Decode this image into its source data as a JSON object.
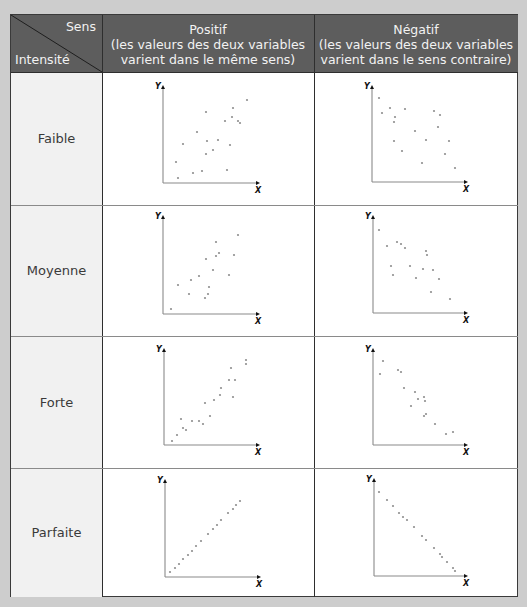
{
  "header": {
    "corner_top": "Sens",
    "corner_bottom": "Intensité",
    "columns": [
      {
        "title": "Positif",
        "line1": "(les valeurs des deux variables",
        "line2": "varient dans le même sens)"
      },
      {
        "title": "Négatif",
        "line1": "(les valeurs des deux variables",
        "line2": "varient dans le sens contraire)"
      }
    ]
  },
  "rows": [
    {
      "label": "Faible"
    },
    {
      "label": "Moyenne"
    },
    {
      "label": "Forte"
    },
    {
      "label": "Parfaite"
    }
  ],
  "axis_labels": {
    "x": "X",
    "y": "Y"
  },
  "colors": {
    "header_bg": "#5d5d5d",
    "header_text": "#f2f2f2",
    "label_bg": "#f1f1f1",
    "dot": "#8f8f8f",
    "axis": "#8a8a8a"
  },
  "chart_data": [
    {
      "type": "scatter",
      "title": "Positif — Faible",
      "xlabel": "X",
      "ylabel": "Y",
      "axes": {
        "ox": 163,
        "oy": 183,
        "top": 85,
        "right": 260
      },
      "points": [
        [
          247,
          100
        ],
        [
          233,
          108
        ],
        [
          206,
          112
        ],
        [
          232,
          117
        ],
        [
          225,
          121
        ],
        [
          238,
          121
        ],
        [
          240,
          123
        ],
        [
          197,
          132
        ],
        [
          183,
          144
        ],
        [
          207,
          141
        ],
        [
          218,
          140
        ],
        [
          230,
          145
        ],
        [
          213,
          150
        ],
        [
          206,
          154
        ],
        [
          176,
          162
        ],
        [
          227,
          170
        ],
        [
          193,
          173
        ],
        [
          202,
          171
        ],
        [
          178,
          178
        ]
      ]
    },
    {
      "type": "scatter",
      "title": "Négatif — Faible",
      "xlabel": "X",
      "ylabel": "Y",
      "axes": {
        "ox": 372,
        "oy": 182,
        "top": 85,
        "right": 468
      },
      "points": [
        [
          379,
          98
        ],
        [
          390,
          108
        ],
        [
          405,
          109
        ],
        [
          382,
          113
        ],
        [
          395,
          117
        ],
        [
          394,
          122
        ],
        [
          434,
          111
        ],
        [
          440,
          115
        ],
        [
          438,
          127
        ],
        [
          415,
          131
        ],
        [
          426,
          140
        ],
        [
          449,
          141
        ],
        [
          394,
          141
        ],
        [
          402,
          151
        ],
        [
          445,
          154
        ],
        [
          422,
          163
        ],
        [
          455,
          168
        ]
      ]
    },
    {
      "type": "scatter",
      "title": "Positif — Moyenne",
      "xlabel": "X",
      "ylabel": "Y",
      "axes": {
        "ox": 163,
        "oy": 314,
        "top": 215,
        "right": 260
      },
      "points": [
        [
          238,
          235
        ],
        [
          216,
          242
        ],
        [
          219,
          253
        ],
        [
          216,
          256
        ],
        [
          234,
          255
        ],
        [
          206,
          259
        ],
        [
          213,
          270
        ],
        [
          229,
          275
        ],
        [
          199,
          276
        ],
        [
          191,
          280
        ],
        [
          178,
          285
        ],
        [
          209,
          287
        ],
        [
          189,
          294
        ],
        [
          208,
          294
        ],
        [
          205,
          298
        ],
        [
          171,
          309
        ]
      ]
    },
    {
      "type": "scatter",
      "title": "Négatif — Moyenne",
      "xlabel": "X",
      "ylabel": "Y",
      "axes": {
        "ox": 373,
        "oy": 313,
        "top": 215,
        "right": 468
      },
      "points": [
        [
          379,
          230
        ],
        [
          387,
          246
        ],
        [
          397,
          242
        ],
        [
          401,
          244
        ],
        [
          405,
          248
        ],
        [
          426,
          251
        ],
        [
          427,
          255
        ],
        [
          391,
          266
        ],
        [
          410,
          266
        ],
        [
          423,
          269
        ],
        [
          433,
          270
        ],
        [
          393,
          275
        ],
        [
          416,
          278
        ],
        [
          439,
          279
        ],
        [
          431,
          292
        ],
        [
          450,
          299
        ]
      ]
    },
    {
      "type": "scatter",
      "title": "Positif — Forte",
      "xlabel": "X",
      "ylabel": "Y",
      "axes": {
        "ox": 164,
        "oy": 445,
        "top": 348,
        "right": 260
      },
      "points": [
        [
          246,
          360
        ],
        [
          246,
          364
        ],
        [
          231,
          368
        ],
        [
          229,
          380
        ],
        [
          235,
          380
        ],
        [
          221,
          388
        ],
        [
          220,
          395
        ],
        [
          233,
          397
        ],
        [
          214,
          400
        ],
        [
          205,
          403
        ],
        [
          210,
          416
        ],
        [
          181,
          419
        ],
        [
          192,
          421
        ],
        [
          199,
          421
        ],
        [
          203,
          424
        ],
        [
          183,
          428
        ],
        [
          186,
          430
        ],
        [
          177,
          435
        ],
        [
          172,
          441
        ]
      ]
    },
    {
      "type": "scatter",
      "title": "Négatif — Forte",
      "xlabel": "X",
      "ylabel": "Y",
      "axes": {
        "ox": 373,
        "oy": 445,
        "top": 348,
        "right": 468
      },
      "points": [
        [
          383,
          361
        ],
        [
          380,
          374
        ],
        [
          398,
          370
        ],
        [
          401,
          372
        ],
        [
          404,
          388
        ],
        [
          415,
          392
        ],
        [
          424,
          397
        ],
        [
          418,
          399
        ],
        [
          425,
          401
        ],
        [
          411,
          406
        ],
        [
          426,
          414
        ],
        [
          424,
          416
        ],
        [
          435,
          424
        ],
        [
          453,
          432
        ],
        [
          446,
          434
        ]
      ]
    },
    {
      "type": "scatter",
      "title": "Positif — Parfaite",
      "xlabel": "X",
      "ylabel": "Y",
      "axes": {
        "ox": 165,
        "oy": 577,
        "top": 479,
        "right": 261
      },
      "points": [
        [
          170,
          572
        ],
        [
          175,
          568
        ],
        [
          179,
          564
        ],
        [
          183,
          559
        ],
        [
          188,
          555
        ],
        [
          192,
          551
        ],
        [
          196,
          546
        ],
        [
          201,
          541
        ],
        [
          208,
          534
        ],
        [
          213,
          529
        ],
        [
          217,
          525
        ],
        [
          221,
          520
        ],
        [
          228,
          513
        ],
        [
          233,
          509
        ],
        [
          236,
          505
        ],
        [
          240,
          501
        ]
      ]
    },
    {
      "type": "scatter",
      "title": "Négatif — Parfaite",
      "xlabel": "X",
      "ylabel": "Y",
      "axes": {
        "ox": 374,
        "oy": 576,
        "top": 478,
        "right": 468
      },
      "points": [
        [
          379,
          492
        ],
        [
          387,
          500
        ],
        [
          393,
          506
        ],
        [
          399,
          513
        ],
        [
          403,
          517
        ],
        [
          407,
          520
        ],
        [
          414,
          527
        ],
        [
          422,
          536
        ],
        [
          426,
          540
        ],
        [
          434,
          548
        ],
        [
          440,
          554
        ],
        [
          442,
          557
        ],
        [
          447,
          562
        ],
        [
          453,
          568
        ],
        [
          455,
          571
        ]
      ]
    }
  ]
}
